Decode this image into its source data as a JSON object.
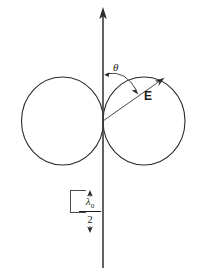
{
  "figure": {
    "type": "technical-line-diagram",
    "background_color": "#ffffff",
    "line_color": "#2b2b2b",
    "labels": {
      "angle": "θ",
      "field_vector": "E",
      "spacing_numerator": "λ",
      "spacing_numerator_subscript": "0",
      "spacing_denominator": "2"
    },
    "axis": {
      "name": "vertical-axis",
      "orientation": "vertical",
      "arrow_at": "top",
      "x": 103,
      "y_top": 8,
      "y_bottom": 268
    },
    "lobes": [
      {
        "name": "left-lobe",
        "center_x": 62.5,
        "center_y": 121,
        "radius_x": 41,
        "radius_y": 44
      },
      {
        "name": "right-lobe",
        "center_x": 144,
        "center_y": 121,
        "radius_x": 41,
        "radius_y": 44
      }
    ],
    "origin": {
      "x": 103,
      "y": 121
    },
    "field_vector": {
      "name": "e-vector",
      "from_x": 103,
      "from_y": 121,
      "to_x": 164,
      "to_y": 78
    },
    "angle_arc": {
      "name": "theta-arc",
      "start_x": 106,
      "start_y": 72,
      "end_x": 137,
      "end_y": 92,
      "double_headed": true
    },
    "dimension": {
      "name": "half-wavelength-spacing",
      "top_tick_y": 190,
      "bottom_tick_y": 232,
      "tick_left_x": 70,
      "tick_right_x": 103,
      "arrow_x": 90
    }
  }
}
